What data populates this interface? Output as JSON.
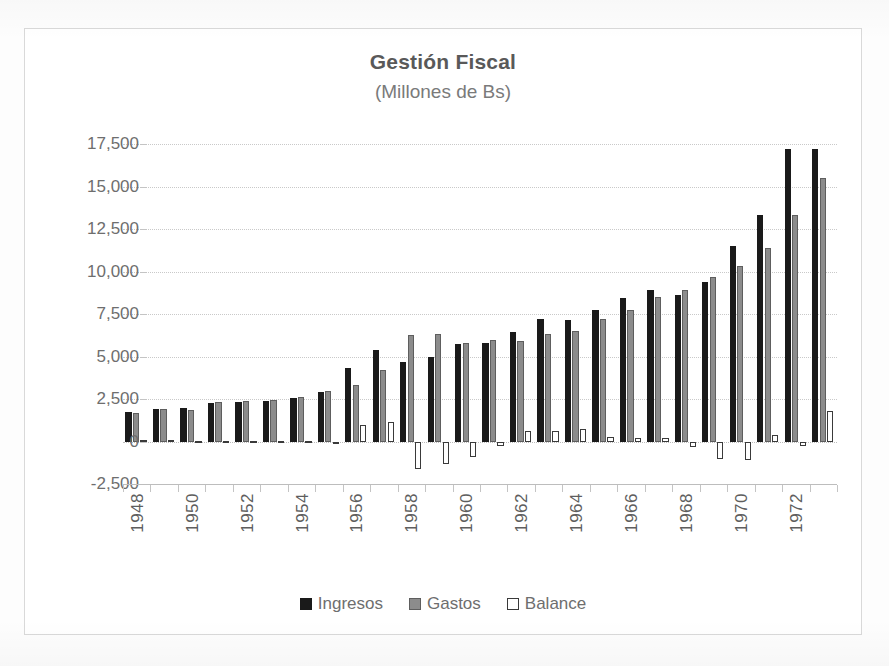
{
  "chart_data": {
    "type": "bar",
    "title": "Gestión Fiscal",
    "subtitle": "(Millones de Bs)",
    "xlabel": "",
    "ylabel": "",
    "ylim": [
      -2500,
      17500
    ],
    "ytick_step": 2500,
    "ytick_labels": [
      "17,500",
      "15,000",
      "12,500",
      "10,000",
      "7,500",
      "5,000",
      "2,500",
      "0",
      "-2,500"
    ],
    "ytick_values": [
      17500,
      15000,
      12500,
      10000,
      7500,
      5000,
      2500,
      0,
      -2500
    ],
    "grid": true,
    "legend_position": "bottom",
    "categories": [
      "1948",
      "1949",
      "1950",
      "1951",
      "1952",
      "1953",
      "1954",
      "1955",
      "1956",
      "1957",
      "1958",
      "1959",
      "1960",
      "1961",
      "1962",
      "1963",
      "1964",
      "1965",
      "1966",
      "1967",
      "1968",
      "1969",
      "1970",
      "1971",
      "1972",
      "1973"
    ],
    "xtick_labels_shown": [
      "1948",
      "1950",
      "1952",
      "1954",
      "1956",
      "1958",
      "1960",
      "1962",
      "1964",
      "1966",
      "1968",
      "1970",
      "1972"
    ],
    "series": [
      {
        "name": "Ingresos",
        "color": "#1a1a1a",
        "values": [
          1750,
          1900,
          1950,
          2250,
          2350,
          2400,
          2550,
          2900,
          4300,
          5400,
          4700,
          4950,
          5750,
          5800,
          6450,
          7200,
          7150,
          7750,
          8450,
          8900,
          8600,
          9400,
          11500,
          13300,
          17200,
          17200
        ]
      },
      {
        "name": "Gastos",
        "color": "#8c8c8c",
        "values": [
          1700,
          1900,
          1850,
          2300,
          2400,
          2450,
          2600,
          2950,
          3300,
          4200,
          6250,
          6300,
          5800,
          6000,
          5900,
          6300,
          6500,
          7200,
          7750,
          8500,
          8900,
          9700,
          10350,
          11400,
          13300,
          15500
        ]
      },
      {
        "name": "Balance",
        "color": "#ffffff",
        "values": [
          100,
          100,
          -100,
          -60,
          -60,
          -60,
          -60,
          -120,
          1000,
          1150,
          -1600,
          -1300,
          -900,
          -250,
          600,
          600,
          750,
          250,
          180,
          200,
          -350,
          -1000,
          -1100,
          400,
          -250,
          1800
        ]
      }
    ]
  },
  "legend": {
    "items": [
      {
        "label": "Ingresos",
        "key": "ingresos"
      },
      {
        "label": "Gastos",
        "key": "gastos"
      },
      {
        "label": "Balance",
        "key": "balance"
      }
    ]
  }
}
